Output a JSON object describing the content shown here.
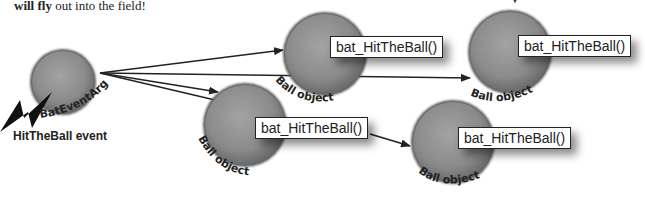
{
  "caption": {
    "bold": "will fly",
    "rest": " out into the field!"
  },
  "source": {
    "args_label": "BatEventArgs",
    "event_label": "HitTheBall event",
    "icon": "lightning-bolt-icon"
  },
  "balls": [
    {
      "label": "Ball object",
      "method": "bat_HitTheBall()"
    },
    {
      "label": "Ball object",
      "method": "bat_HitTheBall()"
    },
    {
      "label": "Ball object",
      "method": "bat_HitTheBall()"
    },
    {
      "label": "Ball object",
      "method": "bat_HitTheBall()"
    }
  ],
  "colors": {
    "ball_fill": "#8a8a8a",
    "ball_edge": "#5a5a5a",
    "line": "#222222"
  }
}
